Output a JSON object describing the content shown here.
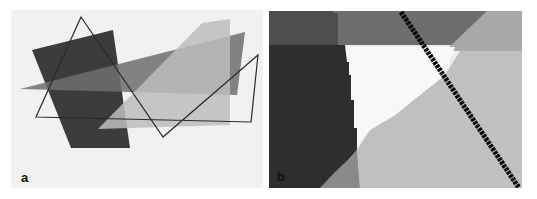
{
  "figure": {
    "panels": [
      {
        "id": "a",
        "label": "a",
        "description": "Overlapping translucent polygons with outlined triangle",
        "background": "#f1f1f1",
        "shapes": {
          "dark_quad": {
            "points": "32,50 113,30 130,148 71,148",
            "fill": "#3c3c3c"
          },
          "medium_wedge": {
            "points": "20,89 245,32 237,95 130,92",
            "fill": "#6f6f6f",
            "opacity": 0.85
          },
          "light_shape": {
            "points": "98,129 202,23 230,19 230,125",
            "fill": "#bdbdbd",
            "opacity": 0.85
          },
          "outline_path": {
            "points": "81,17 163,137 258,55 251,122 36,117",
            "stroke": "#2a2a2a"
          }
        }
      },
      {
        "id": "b",
        "label": "b",
        "description": "Pixelated zoomed region of overlapping shapes with diagonal black line",
        "background": "#eeeeee",
        "shapes": {
          "top_left_dark": {
            "points": "269,11 334,11 334,13 338,13 338,45 269,45",
            "fill": "#4e4e4e"
          },
          "top_mid_medium": {
            "points": "334,11 487,11 460,45 338,45 338,13 334,13",
            "fill": "#6e6e6e"
          },
          "top_right_light": {
            "points": "487,11 522,11 522,51 445,51",
            "fill": "#a8a8a8"
          },
          "left_dark": {
            "points": "269,45 345,45 347,62 349,62 349,75 351,75 351,100 354,100 354,128 357,128 357,150 350,158 330,182 320,188 269,188",
            "fill": "#2e2e2e"
          },
          "white_region": {
            "points": "345,47 455,47 445,75 420,95 395,115 370,130 357,145 357,128 354,128 354,100 351,100 351,75 349,75 349,62 347,62",
            "fill": "#f8f8f8"
          },
          "bottom_mid_gray": {
            "points": "357,150 360,188 320,188 335,172 350,158",
            "fill": "#8a8a8a"
          },
          "big_light": {
            "points": "357,150 370,130 395,115 420,95 445,75 460,51 522,51 522,188 360,188",
            "fill": "#c0c0c0"
          },
          "black_diagonal": {
            "x1": 401,
            "y1": 12,
            "x2": 519,
            "y2": 188,
            "stroke": "#050505",
            "width": 5
          }
        }
      }
    ]
  }
}
